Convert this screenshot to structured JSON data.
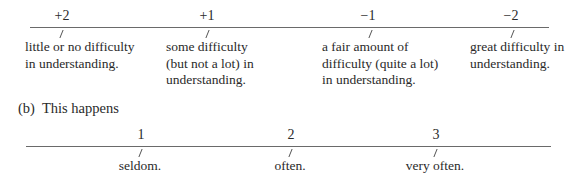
{
  "scale_a": {
    "points": [
      {
        "value": "+2",
        "lines": [
          "little or no difficulty",
          "in understanding."
        ]
      },
      {
        "value": "+1",
        "lines": [
          "some difficulty",
          "(but not a lot) in",
          "understanding."
        ]
      },
      {
        "value": "−1",
        "lines": [
          "a fair amount of",
          "difficulty (quite a lot)",
          "in understanding."
        ]
      },
      {
        "value": "−2",
        "lines": [
          "great difficulty in",
          "understanding."
        ]
      }
    ]
  },
  "scale_b": {
    "label_tag": "(b)",
    "label_text": "This happens",
    "points": [
      {
        "value": "1",
        "label": "seldom."
      },
      {
        "value": "2",
        "label": "often."
      },
      {
        "value": "3",
        "label": "very often."
      }
    ]
  }
}
